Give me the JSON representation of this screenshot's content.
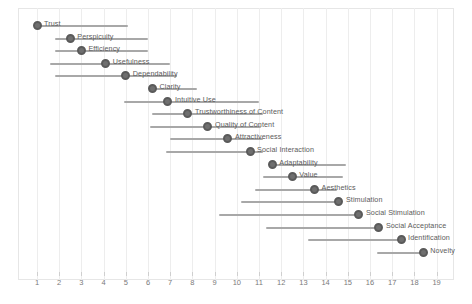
{
  "chart_data": {
    "type": "scatter",
    "title": "",
    "subtitle": "",
    "xlabel": "",
    "ylabel": "",
    "xlim": [
      0.4,
      19.6
    ],
    "grid": true,
    "legend": "none",
    "xticks": [
      1,
      2,
      3,
      4,
      5,
      6,
      7,
      8,
      9,
      10,
      11,
      12,
      13,
      14,
      15,
      16,
      17,
      18,
      19
    ],
    "marker_color": "#6f6f6f",
    "line_color": "#a8a8a8",
    "categories": [
      "Trust",
      "Perspicuity",
      "Efficiency",
      "Usefulness",
      "Dependability",
      "Clarity",
      "Intuitive Use",
      "Trustworthiness of Content",
      "Quality of Content",
      "Attractiveness",
      "Social Interaction",
      "Adaptability",
      "Value",
      "Aesthetics",
      "Stimulation",
      "Social Stimulation",
      "Social Acceptance",
      "Identification",
      "Novelty"
    ],
    "values": [
      1.0,
      2.5,
      3.0,
      4.1,
      5.0,
      6.2,
      6.9,
      7.8,
      8.7,
      9.6,
      10.6,
      11.6,
      12.5,
      13.5,
      14.6,
      15.5,
      16.4,
      17.4,
      18.4
    ],
    "ci_low": [
      1.0,
      1.8,
      1.8,
      1.6,
      1.8,
      8.2,
      4.9,
      6.2,
      6.1,
      7.0,
      6.8,
      11.6,
      11.2,
      10.8,
      10.2,
      9.2,
      11.3,
      13.2,
      16.3
    ],
    "ci_high": [
      5.1,
      6.0,
      6.0,
      7.0,
      7.3,
      6.2,
      11.0,
      11.2,
      11.1,
      11.2,
      11.2,
      14.9,
      14.8,
      14.5,
      14.6,
      15.5,
      16.4,
      17.4,
      18.4
    ],
    "label_side": [
      "right",
      "right",
      "right",
      "right",
      "right",
      "right",
      "right",
      "right",
      "right",
      "right",
      "right",
      "right",
      "right",
      "right",
      "right",
      "right",
      "right",
      "right",
      "right"
    ]
  }
}
